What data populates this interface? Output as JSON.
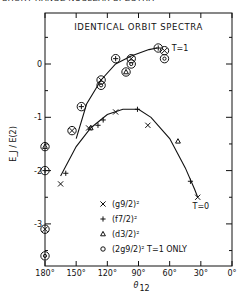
{
  "header_caption": "SHORT RANGE NUCLEAR SPECTRA",
  "chart_data": {
    "type": "scatter",
    "title": "IDENTICAL ORBIT SPECTRA",
    "xlabel": "θ12",
    "ylabel": "E_J / E(2)",
    "xlim": [
      180,
      0
    ],
    "ylim": [
      -3.7,
      0.65
    ],
    "x_ticks": [
      "180°",
      "150°",
      "120°",
      "90°",
      "60°",
      "30°",
      "0°"
    ],
    "y_ticks": [
      "0",
      "-1",
      "-2",
      "-3"
    ],
    "curve_labels": {
      "t1": "T=1",
      "t0": "T=0"
    },
    "legend": [
      {
        "marker": "×",
        "label": "(g9/2)²"
      },
      {
        "marker": "+",
        "label": "(f7/2)²"
      },
      {
        "marker": "△",
        "label": "(d3/2)²"
      },
      {
        "marker": "○",
        "label": "(2g9/2)²  T=1 ONLY"
      }
    ],
    "series": [
      {
        "name": "T=1 (g9/2)^2",
        "marker": "⊗",
        "points": [
          [
            180,
            -3.1
          ],
          [
            154,
            -1.25
          ],
          [
            126,
            -0.3
          ],
          [
            97,
            0.1
          ],
          [
            65,
            0.25
          ]
        ]
      },
      {
        "name": "T=1 (f7/2)^2",
        "marker": "⊕",
        "points": [
          [
            180,
            -2.0
          ],
          [
            145,
            -0.8
          ],
          [
            112,
            0.1
          ],
          [
            71,
            0.3
          ]
        ]
      },
      {
        "name": "T=1 (d3/2)^2",
        "marker": "△○",
        "points": [
          [
            180,
            -1.55
          ],
          [
            102,
            -0.15
          ]
        ]
      },
      {
        "name": "T=1 (2g9/2)^2",
        "marker": "◎",
        "points": [
          [
            180,
            -3.6
          ],
          [
            126,
            -0.4
          ],
          [
            97,
            0.0
          ],
          [
            65,
            0.1
          ]
        ]
      },
      {
        "name": "T=0 (g9/2)^2",
        "marker": "×",
        "points": [
          [
            165,
            -2.25
          ],
          [
            138,
            -1.2
          ],
          [
            112,
            -0.9
          ],
          [
            81,
            -1.15
          ],
          [
            33,
            -2.5
          ]
        ]
      },
      {
        "name": "T=0 (f7/2)^2",
        "marker": "+",
        "points": [
          [
            160,
            -2.05
          ],
          [
            129,
            -1.15
          ],
          [
            124,
            -1.05
          ],
          [
            91,
            -0.85
          ],
          [
            40,
            -2.2
          ]
        ]
      },
      {
        "name": "T=0 (d3/2)^2",
        "marker": "△",
        "points": [
          [
            136,
            -1.2
          ],
          [
            52,
            -1.45
          ]
        ]
      }
    ],
    "curves": {
      "t1": [
        [
          150,
          -1.4
        ],
        [
          140,
          -0.75
        ],
        [
          126,
          -0.3
        ],
        [
          112,
          0.0
        ],
        [
          97,
          0.15
        ],
        [
          80,
          0.27
        ],
        [
          72,
          0.3
        ]
      ],
      "t0": [
        [
          165,
          -2.1
        ],
        [
          150,
          -1.55
        ],
        [
          136,
          -1.2
        ],
        [
          120,
          -0.95
        ],
        [
          105,
          -0.85
        ],
        [
          90,
          -0.85
        ],
        [
          78,
          -1.0
        ],
        [
          60,
          -1.4
        ],
        [
          45,
          -1.95
        ],
        [
          36,
          -2.35
        ],
        [
          33,
          -2.5
        ]
      ]
    }
  }
}
